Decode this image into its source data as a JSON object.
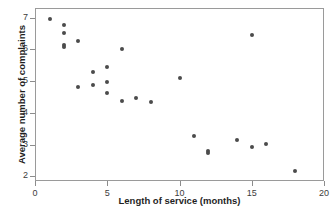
{
  "figure": {
    "top_clipped_text": "",
    "background_color": "#ffffff",
    "point_color": "#4b4b4b",
    "axis_color": "#9a9a9a"
  },
  "axes": {
    "x_title": "Length of service (months)",
    "y_title": "Average number of complaints",
    "x_ticks": [
      "0",
      "5",
      "10",
      "15",
      "20"
    ],
    "y_ticks": [
      "2",
      "3",
      "4",
      "5",
      "6",
      "7"
    ]
  },
  "chart_data": {
    "type": "scatter",
    "title": "",
    "xlabel": "Length of service (months)",
    "ylabel": "Average number of complaints",
    "xlim": [
      0,
      20
    ],
    "ylim": [
      1.75,
      7.35
    ],
    "xticks": [
      0,
      5,
      10,
      15,
      20
    ],
    "yticks": [
      2,
      3,
      4,
      5,
      6,
      7
    ],
    "grid": false,
    "legend": null,
    "marker": "filled-circle",
    "marker_color": "#4b4b4b",
    "marker_size_px": 4,
    "n_points": 25,
    "x": [
      1,
      2,
      2,
      2,
      2,
      3,
      3,
      4,
      4,
      5,
      5,
      5,
      6,
      6,
      7,
      8,
      10,
      11,
      12,
      12,
      14,
      15,
      15,
      16,
      18
    ],
    "y": [
      6.95,
      6.77,
      6.52,
      6.12,
      6.07,
      6.25,
      4.8,
      5.27,
      4.87,
      5.45,
      4.97,
      4.62,
      6.0,
      4.37,
      4.47,
      4.35,
      5.1,
      3.27,
      2.8,
      2.73,
      3.15,
      6.45,
      2.93,
      3.03,
      2.18
    ],
    "points": [
      {
        "x": 1,
        "y": 6.95
      },
      {
        "x": 2,
        "y": 6.77
      },
      {
        "x": 2,
        "y": 6.52
      },
      {
        "x": 2,
        "y": 6.12
      },
      {
        "x": 2,
        "y": 6.07
      },
      {
        "x": 3,
        "y": 6.25
      },
      {
        "x": 3,
        "y": 4.8
      },
      {
        "x": 4,
        "y": 5.27
      },
      {
        "x": 4,
        "y": 4.87
      },
      {
        "x": 5,
        "y": 5.45
      },
      {
        "x": 5,
        "y": 4.97
      },
      {
        "x": 5,
        "y": 4.62
      },
      {
        "x": 6,
        "y": 6.0
      },
      {
        "x": 6,
        "y": 4.37
      },
      {
        "x": 7,
        "y": 4.47
      },
      {
        "x": 8,
        "y": 4.35
      },
      {
        "x": 10,
        "y": 5.1
      },
      {
        "x": 11,
        "y": 3.27
      },
      {
        "x": 12,
        "y": 2.8
      },
      {
        "x": 12,
        "y": 2.73
      },
      {
        "x": 14,
        "y": 3.15
      },
      {
        "x": 15,
        "y": 6.45
      },
      {
        "x": 15,
        "y": 2.93
      },
      {
        "x": 16,
        "y": 3.03
      },
      {
        "x": 18,
        "y": 2.18
      }
    ]
  }
}
